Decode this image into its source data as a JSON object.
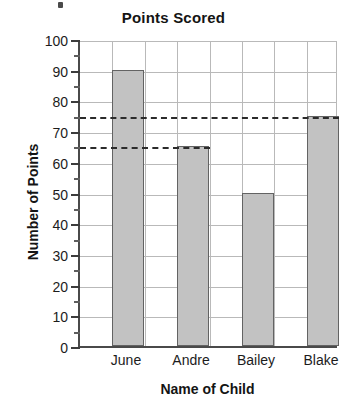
{
  "chart_data": {
    "type": "bar",
    "title": "Points Scored",
    "xlabel": "Name of Child",
    "ylabel": "Number of Points",
    "categories": [
      "June",
      "Andre",
      "Bailey",
      "Blake"
    ],
    "values": [
      90,
      65,
      50,
      75
    ],
    "ylim": [
      0,
      100
    ],
    "ytick_interval": 10,
    "yminor_tick_interval": 5,
    "ytick_labels": [
      "0",
      "10",
      "20",
      "30",
      "40",
      "50",
      "60",
      "70",
      "80",
      "90",
      "100"
    ],
    "grid": "horizontal-and-vertical",
    "legend": "none",
    "bar_color": "#c2c2c2",
    "bar_edge_color": "#636363",
    "grid_color": "#b9b9b9",
    "axis_color": "#4a4a4a",
    "reference_lines": [
      {
        "value": 75,
        "style": "dashed",
        "color": "#2b2b2b",
        "extends_to": "Blake"
      },
      {
        "value": 65,
        "style": "dashed",
        "color": "#2b2b2b",
        "extends_to": "Andre"
      }
    ]
  }
}
